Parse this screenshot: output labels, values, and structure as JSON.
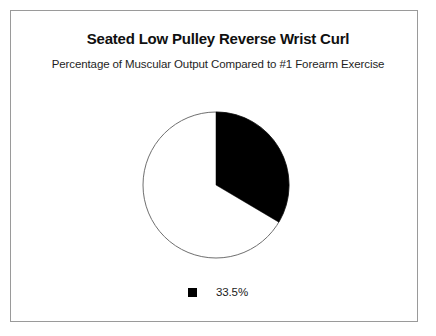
{
  "frame": {
    "border_color": "#9a9a9a",
    "background": "#ffffff"
  },
  "chart_data": {
    "type": "pie",
    "title": "Seated Low Pulley Reverse Wrist Curl",
    "subtitle": "Percentage of Muscular Output Compared to #1 Forearm Exercise",
    "categories": [
      "33.5%"
    ],
    "values": [
      33.5
    ],
    "remainder": 66.5,
    "units": "percent",
    "start_angle_deg": 0,
    "direction": "clockwise",
    "slice_angle_deg": 120.6,
    "colors": {
      "slice": "#000000",
      "remainder": "#ffffff",
      "outline": "#6f6f6f"
    },
    "legend": {
      "position": "bottom",
      "entries": [
        {
          "label": "33.5%",
          "color": "#000000",
          "marker": "square"
        }
      ]
    },
    "xlabel": "",
    "ylabel": "",
    "grid": false
  },
  "geometry": {
    "center_x": 74,
    "center_y": 74,
    "radius": 73
  }
}
